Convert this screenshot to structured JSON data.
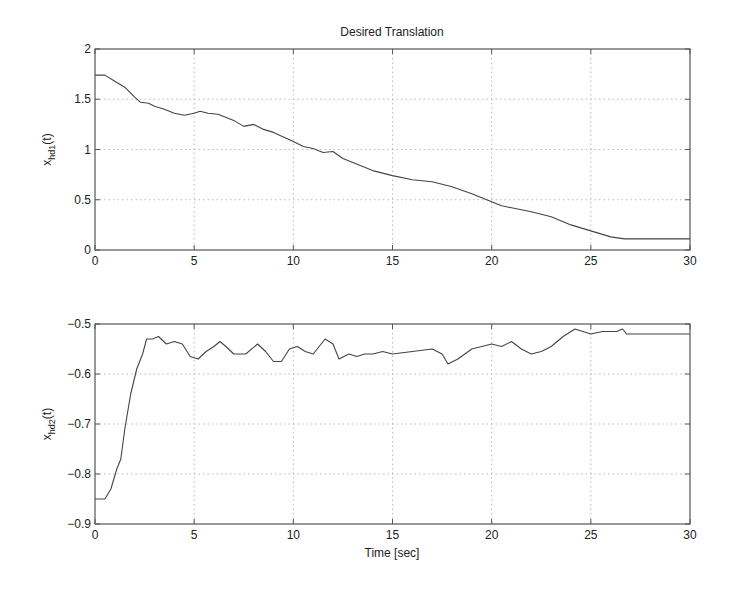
{
  "figure": {
    "title": "Desired Translation",
    "xlabel": "Time [sec]"
  },
  "chart_data": [
    {
      "type": "line",
      "title": "Desired Translation",
      "xlabel": "",
      "ylabel": "x_hd1(t)",
      "ylabel_main": "x",
      "ylabel_sub": "hd1",
      "ylabel_suffix": "(t)",
      "xlim": [
        0,
        30
      ],
      "ylim": [
        0,
        2
      ],
      "xticks": [
        0,
        5,
        10,
        15,
        20,
        25,
        30
      ],
      "yticks": [
        0,
        0.5,
        1,
        1.5,
        2
      ],
      "ytick_labels": [
        "0",
        "0.5",
        "1",
        "1.5",
        "2"
      ],
      "grid": true,
      "series": [
        {
          "name": "x_hd1",
          "x": [
            0,
            0.5,
            1,
            1.5,
            2,
            2.3,
            2.7,
            3,
            3.5,
            4,
            4.5,
            5,
            5.3,
            5.7,
            6.2,
            7,
            7.5,
            8,
            8.5,
            9,
            10,
            10.5,
            11,
            11.5,
            12,
            12.5,
            13,
            14,
            15,
            16,
            17,
            18,
            19,
            20,
            20.5,
            21,
            22,
            23,
            24,
            25,
            26,
            26.7,
            30
          ],
          "y": [
            1.74,
            1.74,
            1.68,
            1.62,
            1.52,
            1.47,
            1.46,
            1.43,
            1.4,
            1.36,
            1.34,
            1.36,
            1.38,
            1.36,
            1.35,
            1.29,
            1.23,
            1.25,
            1.2,
            1.17,
            1.08,
            1.03,
            1.01,
            0.97,
            0.98,
            0.91,
            0.87,
            0.79,
            0.74,
            0.7,
            0.68,
            0.63,
            0.56,
            0.48,
            0.44,
            0.42,
            0.38,
            0.33,
            0.25,
            0.19,
            0.13,
            0.11,
            0.11
          ]
        }
      ]
    },
    {
      "type": "line",
      "title": "",
      "xlabel": "Time [sec]",
      "ylabel": "x_hd2(t)",
      "ylabel_main": "x",
      "ylabel_sub": "hd2",
      "ylabel_suffix": "(t)",
      "xlim": [
        0,
        30
      ],
      "ylim": [
        -0.9,
        -0.5
      ],
      "xticks": [
        0,
        5,
        10,
        15,
        20,
        25,
        30
      ],
      "yticks": [
        -0.9,
        -0.8,
        -0.7,
        -0.6,
        -0.5
      ],
      "ytick_labels": [
        "-0.9",
        "-0.8",
        "-0.7",
        "-0.6",
        "-0.5"
      ],
      "grid": true,
      "series": [
        {
          "name": "x_hd2",
          "x": [
            0,
            0.5,
            0.8,
            1.1,
            1.3,
            1.5,
            1.8,
            2.1,
            2.4,
            2.6,
            2.9,
            3.2,
            3.6,
            4,
            4.4,
            4.8,
            5.2,
            5.6,
            6,
            6.3,
            6.6,
            7,
            7.6,
            8.2,
            8.6,
            9,
            9.4,
            9.8,
            10.2,
            10.6,
            11,
            11.6,
            12,
            12.3,
            12.8,
            13.2,
            13.6,
            14,
            14.5,
            15,
            16,
            17,
            17.5,
            17.8,
            18.3,
            19,
            19.5,
            20,
            20.5,
            21,
            21.5,
            22,
            22.5,
            23,
            23.6,
            24.2,
            25,
            25.6,
            26.3,
            26.6,
            26.8,
            30
          ],
          "y": [
            -0.85,
            -0.85,
            -0.83,
            -0.79,
            -0.77,
            -0.71,
            -0.64,
            -0.59,
            -0.56,
            -0.53,
            -0.53,
            -0.525,
            -0.54,
            -0.535,
            -0.54,
            -0.565,
            -0.57,
            -0.555,
            -0.545,
            -0.535,
            -0.545,
            -0.56,
            -0.56,
            -0.54,
            -0.555,
            -0.575,
            -0.575,
            -0.55,
            -0.545,
            -0.555,
            -0.56,
            -0.53,
            -0.54,
            -0.57,
            -0.56,
            -0.565,
            -0.56,
            -0.56,
            -0.555,
            -0.56,
            -0.555,
            -0.55,
            -0.56,
            -0.58,
            -0.57,
            -0.55,
            -0.545,
            -0.54,
            -0.545,
            -0.535,
            -0.55,
            -0.56,
            -0.555,
            -0.545,
            -0.525,
            -0.51,
            -0.52,
            -0.515,
            -0.515,
            -0.51,
            -0.52,
            -0.52
          ]
        }
      ]
    }
  ]
}
